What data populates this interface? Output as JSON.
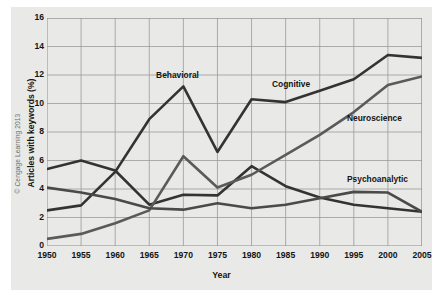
{
  "credit": "© Cengage Learning 2013",
  "chart_data": {
    "type": "line",
    "title": "",
    "xlabel": "Year",
    "ylabel": "Articles with keywords (%)",
    "xlim": [
      1950,
      2005
    ],
    "ylim": [
      0,
      16
    ],
    "ytick_labels": [
      "0",
      "2",
      "4",
      "6",
      "8",
      "10",
      "12",
      "14",
      "16"
    ],
    "ytick_values": [
      0,
      2,
      4,
      6,
      8,
      10,
      12,
      14,
      16
    ],
    "grid": true,
    "legend_position": "inline-labels",
    "x": [
      1950,
      1955,
      1960,
      1965,
      1970,
      1975,
      1980,
      1985,
      1990,
      1995,
      2000,
      2005
    ],
    "xtick_labels": [
      "1950",
      "1955",
      "1960",
      "1965",
      "1970",
      "1975",
      "1980",
      "1985",
      "1990",
      "1995",
      "2000",
      "2005"
    ],
    "series": [
      {
        "name": "Behavioral",
        "color": "#333333",
        "label_x": 1966,
        "label_y": 11.9,
        "values": [
          5.4,
          6.0,
          5.3,
          2.9,
          3.6,
          3.55,
          5.6,
          4.2,
          3.4,
          2.9,
          2.65,
          2.4
        ]
      },
      {
        "name": "Cognitive",
        "color": "#333333",
        "label_x": 1983,
        "label_y": 11.3,
        "values": [
          2.5,
          2.85,
          5.2,
          8.9,
          11.2,
          6.6,
          10.3,
          10.1,
          10.9,
          11.7,
          13.4,
          13.2
        ]
      },
      {
        "name": "Neuroscience",
        "color": "#5a5a5a",
        "label_x": 1994,
        "label_y": 8.9,
        "values": [
          0.5,
          0.85,
          1.6,
          2.5,
          6.3,
          4.1,
          5.0,
          6.4,
          7.8,
          9.4,
          11.3,
          11.9
        ]
      },
      {
        "name": "Psychoanalytic",
        "color": "#4a4a4a",
        "label_x": 1994,
        "label_y": 4.6,
        "values": [
          4.1,
          3.75,
          3.3,
          2.65,
          2.55,
          3.0,
          2.65,
          2.9,
          3.35,
          3.8,
          3.75,
          2.4
        ]
      }
    ]
  }
}
